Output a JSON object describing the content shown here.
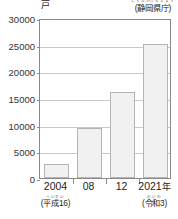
{
  "chart_data": {
    "type": "bar",
    "title": "",
    "subtitle": "",
    "unit_label": "戸",
    "xlabel": "",
    "ylabel": "",
    "ylim": [
      0,
      30000
    ],
    "ytick_interval": 5000,
    "yticks": [
      "0",
      "5000",
      "10000",
      "15000",
      "20000",
      "25000",
      "30000"
    ],
    "grid": true,
    "legend": "none",
    "categories": [
      "2004",
      "08",
      "12",
      "2021年"
    ],
    "values": [
      2700,
      9400,
      16200,
      25100
    ],
    "bars": [
      {
        "label": "2004",
        "value": 2700
      },
      {
        "label": "08",
        "value": 9400
      },
      {
        "label": "12",
        "value": 16200
      },
      {
        "label": "2021",
        "value": 25100,
        "suffix": "年"
      }
    ],
    "annotations": [
      {
        "name": "era-2004",
        "ruby": "へいせい",
        "text": "(平成16)"
      },
      {
        "name": "era-2021",
        "ruby": "れいわ",
        "text": "(令和3)"
      }
    ],
    "source": {
      "ruby": "しずおかけんちょう",
      "text": "(静岡県庁)"
    },
    "colors": {
      "bar_fill": "#f1f1f1",
      "bar_border": "#b4b4b4",
      "axis": "#8a8a8a",
      "grid": "#c9c9c9",
      "text": "#222222",
      "ruby": "#555555",
      "background": "#ffffff"
    }
  }
}
